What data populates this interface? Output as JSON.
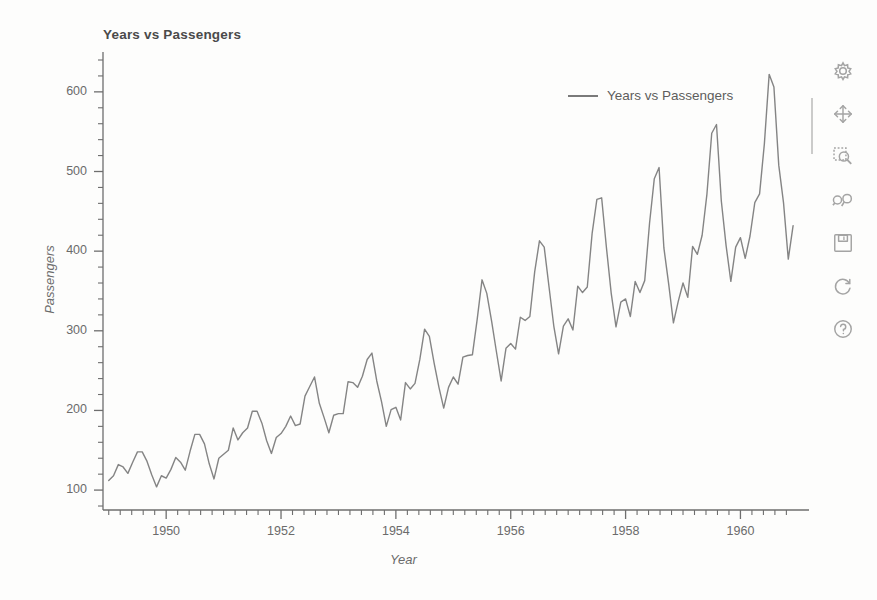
{
  "window": {
    "title": "Years vs Passengers"
  },
  "chart_data": {
    "type": "line",
    "title": "Years vs Passengers",
    "xlabel": "Year",
    "ylabel": "Passengers",
    "xlim": [
      1948.9,
      1960.95
    ],
    "ylim": [
      75,
      640
    ],
    "xticks": [
      1950,
      1952,
      1954,
      1956,
      1958,
      1960
    ],
    "xtick_labels": [
      "1950",
      "1952",
      "1954",
      "1956",
      "1958",
      "1960"
    ],
    "yticks": [
      100,
      200,
      300,
      400,
      500,
      600
    ],
    "ytick_labels": [
      "100",
      "200",
      "300",
      "400",
      "500",
      "600"
    ],
    "minor_ticks_per_major_x": 4,
    "minor_ticks_per_major_y": 4,
    "grid": false,
    "legend": {
      "position": "top-right",
      "entries": [
        "Years vs Passengers"
      ]
    },
    "line_color": "#7a7a7a",
    "line_width": 1.4,
    "series": [
      {
        "name": "Years vs Passengers",
        "x": [
          1949.0,
          1949.083,
          1949.167,
          1949.25,
          1949.333,
          1949.417,
          1949.5,
          1949.583,
          1949.667,
          1949.75,
          1949.833,
          1949.917,
          1950.0,
          1950.083,
          1950.167,
          1950.25,
          1950.333,
          1950.417,
          1950.5,
          1950.583,
          1950.667,
          1950.75,
          1950.833,
          1950.917,
          1951.0,
          1951.083,
          1951.167,
          1951.25,
          1951.333,
          1951.417,
          1951.5,
          1951.583,
          1951.667,
          1951.75,
          1951.833,
          1951.917,
          1952.0,
          1952.083,
          1952.167,
          1952.25,
          1952.333,
          1952.417,
          1952.5,
          1952.583,
          1952.667,
          1952.75,
          1952.833,
          1952.917,
          1953.0,
          1953.083,
          1953.167,
          1953.25,
          1953.333,
          1953.417,
          1953.5,
          1953.583,
          1953.667,
          1953.75,
          1953.833,
          1953.917,
          1954.0,
          1954.083,
          1954.167,
          1954.25,
          1954.333,
          1954.417,
          1954.5,
          1954.583,
          1954.667,
          1954.75,
          1954.833,
          1954.917,
          1955.0,
          1955.083,
          1955.167,
          1955.25,
          1955.333,
          1955.417,
          1955.5,
          1955.583,
          1955.667,
          1955.75,
          1955.833,
          1955.917,
          1956.0,
          1956.083,
          1956.167,
          1956.25,
          1956.333,
          1956.417,
          1956.5,
          1956.583,
          1956.667,
          1956.75,
          1956.833,
          1956.917,
          1957.0,
          1957.083,
          1957.167,
          1957.25,
          1957.333,
          1957.417,
          1957.5,
          1957.583,
          1957.667,
          1957.75,
          1957.833,
          1957.917,
          1958.0,
          1958.083,
          1958.167,
          1958.25,
          1958.333,
          1958.417,
          1958.5,
          1958.583,
          1958.667,
          1958.75,
          1958.833,
          1958.917,
          1959.0,
          1959.083,
          1959.167,
          1959.25,
          1959.333,
          1959.417,
          1959.5,
          1959.583,
          1959.667,
          1959.75,
          1959.833,
          1959.917,
          1960.0,
          1960.083,
          1960.167,
          1960.25,
          1960.333,
          1960.417,
          1960.5,
          1960.583,
          1960.667,
          1960.75,
          1960.833,
          1960.917
        ],
        "values": [
          112,
          118,
          132,
          129,
          121,
          135,
          148,
          148,
          136,
          119,
          104,
          118,
          115,
          126,
          141,
          135,
          125,
          149,
          170,
          170,
          158,
          133,
          114,
          140,
          145,
          150,
          178,
          163,
          172,
          178,
          199,
          199,
          184,
          162,
          146,
          166,
          171,
          180,
          193,
          181,
          183,
          218,
          230,
          242,
          209,
          191,
          172,
          194,
          196,
          196,
          236,
          235,
          229,
          243,
          264,
          272,
          237,
          211,
          180,
          201,
          204,
          188,
          235,
          227,
          234,
          264,
          302,
          293,
          259,
          229,
          203,
          229,
          242,
          233,
          267,
          269,
          270,
          315,
          364,
          347,
          312,
          274,
          237,
          278,
          284,
          277,
          317,
          313,
          318,
          374,
          413,
          405,
          355,
          306,
          271,
          306,
          315,
          301,
          356,
          348,
          355,
          422,
          465,
          467,
          404,
          347,
          305,
          336,
          340,
          318,
          362,
          348,
          363,
          435,
          491,
          505,
          404,
          359,
          310,
          337,
          360,
          342,
          406,
          396,
          420,
          472,
          548,
          559,
          463,
          407,
          362,
          405,
          417,
          391,
          419,
          461,
          472,
          535,
          622,
          606,
          508,
          461,
          390,
          432
        ]
      }
    ]
  },
  "toolbar": {
    "items": [
      {
        "name": "properties-gear-icon",
        "label": "Properties"
      },
      {
        "name": "pan-move-icon",
        "label": "Pan"
      },
      {
        "name": "zoom-in-icon",
        "label": "Zoom In"
      },
      {
        "name": "zoom-out-icon",
        "label": "Zoom Out"
      },
      {
        "name": "save-floppy-icon",
        "label": "Save"
      },
      {
        "name": "reset-refresh-icon",
        "label": "Auto Range"
      },
      {
        "name": "help-question-icon",
        "label": "Help"
      }
    ]
  }
}
